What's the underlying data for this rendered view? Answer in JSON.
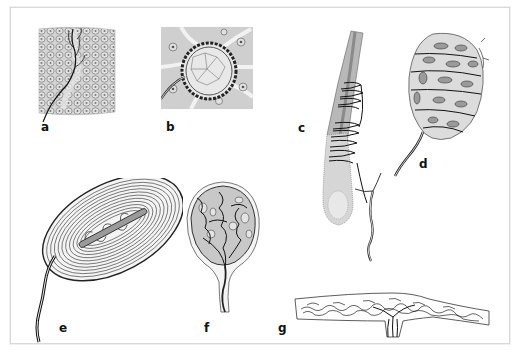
{
  "figure": {
    "background": "#ffffff",
    "border_color": "#d9d9d9",
    "panels": [
      {
        "id": "a",
        "label": "a",
        "depiction": "free nerve endings branching among epidermal cells"
      },
      {
        "id": "b",
        "label": "b",
        "depiction": "nerve fibers encircling a cluster of cells (Merkel-type)"
      },
      {
        "id": "c",
        "label": "c",
        "depiction": "nerve fibers wrapped around a hair shaft and follicle"
      },
      {
        "id": "d",
        "label": "d",
        "depiction": "ovoid encapsulated corpuscle with stacked cells (Meissner-type)"
      },
      {
        "id": "e",
        "label": "e",
        "depiction": "lamellated oval corpuscle with central axon (Pacinian-type)"
      },
      {
        "id": "f",
        "label": "f",
        "depiction": "round corpuscle with tangled nerve terminals (Krause-type)"
      },
      {
        "id": "g",
        "label": "g",
        "depiction": "elongated spindle with branching terminals (Ruffini-type)"
      }
    ]
  }
}
